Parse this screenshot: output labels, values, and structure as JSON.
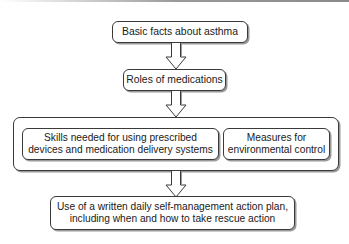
{
  "diagram": {
    "type": "flowchart",
    "direction": "top-to-bottom",
    "nodes": [
      {
        "id": "basic_facts",
        "label": "Basic facts about asthma"
      },
      {
        "id": "roles_medications",
        "label": "Roles of medications"
      },
      {
        "id": "group_skills_measures",
        "label": "",
        "children": [
          "skills_devices",
          "environmental_measures"
        ]
      },
      {
        "id": "skills_devices",
        "label_lines": [
          "Skills needed for using prescribed",
          "devices and medication delivery systems"
        ]
      },
      {
        "id": "environmental_measures",
        "label_lines": [
          "Measures for",
          "environmental control"
        ]
      },
      {
        "id": "action_plan",
        "label_lines": [
          "Use of a written daily self-management action plan,",
          "including when and how to take rescue action"
        ]
      }
    ],
    "edges": [
      {
        "from": "basic_facts",
        "to": "roles_medications",
        "style": "hollow-block-arrow"
      },
      {
        "from": "roles_medications",
        "to": "group_skills_measures",
        "style": "hollow-block-arrow"
      },
      {
        "from": "group_skills_measures",
        "to": "action_plan",
        "style": "hollow-block-arrow"
      }
    ]
  },
  "boxes": {
    "basic_facts": "Basic facts about asthma",
    "roles_medications": "Roles of medications",
    "skills_line1": "Skills needed for using prescribed",
    "skills_line2": "devices and medication delivery systems",
    "measures_line1": "Measures for",
    "measures_line2": "environmental control",
    "action_line1": "Use of a written daily self-management action plan,",
    "action_line2": "including when and how to take rescue action"
  },
  "colors": {
    "border": "#3a3a3a",
    "shadow": "#9a9a9a",
    "background": "#ffffff"
  }
}
